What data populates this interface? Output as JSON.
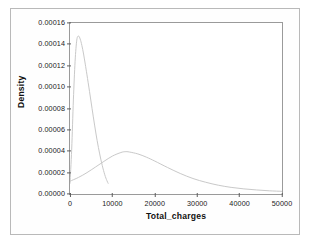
{
  "chart_data": {
    "type": "line",
    "title": "",
    "subtitle": "",
    "xlabel": "Total_charges",
    "ylabel": "Density",
    "xlim": [
      0,
      50000
    ],
    "ylim": [
      0.0,
      0.00016
    ],
    "grid": false,
    "legend": "none",
    "xticks": [
      0,
      10000,
      20000,
      30000,
      40000,
      50000
    ],
    "xtick_labels": [
      "0",
      "10000",
      "20000",
      "30000",
      "40000",
      "50000"
    ],
    "yticks": [
      0.0,
      2e-05,
      4e-05,
      6e-05,
      8e-05,
      0.0001,
      0.00012,
      0.00014,
      0.00016
    ],
    "ytick_labels": [
      "0.00000",
      "0.00002",
      "0.00004",
      "0.00006",
      "0.00008",
      "0.00010",
      "0.00012",
      "0.00014",
      "0.00016"
    ],
    "series": [
      {
        "name": "narrow-density-curve",
        "color": "#c9c9c9",
        "x": [
          0,
          400,
          800,
          1200,
          1600,
          2000,
          2400,
          2800,
          3200,
          3600,
          4000,
          4600,
          5200,
          5800,
          6400,
          7000,
          7600,
          8200,
          8700,
          9000
        ],
        "values": [
          1e-05,
          4.2e-05,
          8.8e-05,
          0.000124,
          0.000144,
          0.0001478,
          0.000145,
          0.000139,
          0.000131,
          0.0001215,
          0.0001115,
          9.6e-05,
          8e-05,
          6.45e-05,
          5e-05,
          3.75e-05,
          2.68e-05,
          1.8e-05,
          1.25e-05,
          1e-05
        ]
      },
      {
        "name": "broad-density-curve",
        "color": "#c9c9c9",
        "x": [
          0,
          2000,
          4000,
          6000,
          8000,
          10000,
          12000,
          13000,
          14000,
          16000,
          18000,
          20000,
          23000,
          26000,
          29000,
          32000,
          35000,
          38000,
          41000,
          44000,
          47000,
          50000
        ],
        "values": [
          1.2e-05,
          1.55e-05,
          2e-05,
          2.52e-05,
          3.05e-05,
          3.55e-05,
          3.88e-05,
          3.96e-05,
          3.93e-05,
          3.75e-05,
          3.45e-05,
          3.08e-05,
          2.48e-05,
          1.92e-05,
          1.45e-05,
          1.1e-05,
          8.2e-06,
          6.2e-06,
          4.8e-06,
          3.8e-06,
          3e-06,
          2.5e-06
        ]
      }
    ],
    "colors": {
      "curve": "#c9c9c9",
      "frame": "#9a9a9a",
      "text": "#1a1a1a",
      "page_border": "#b9b9b9",
      "background": "#ffffff"
    }
  }
}
